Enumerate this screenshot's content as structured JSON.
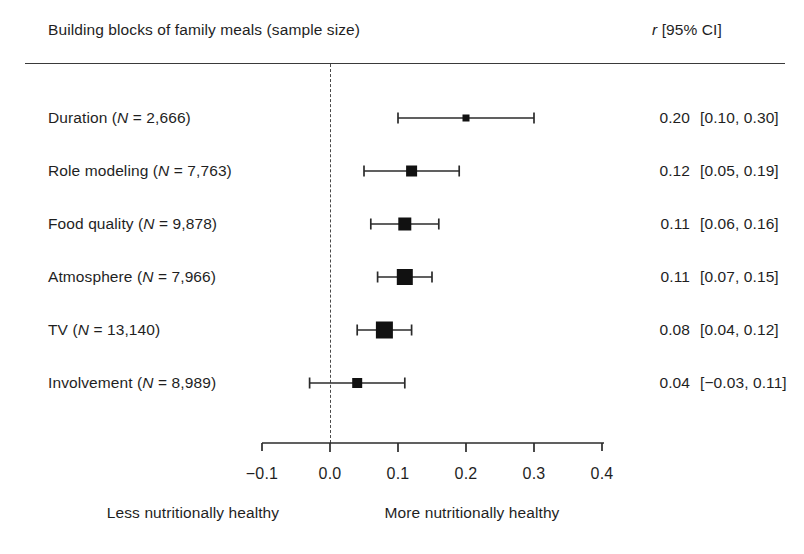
{
  "header": {
    "left_title": "Building blocks of family meals (sample size)",
    "right_title_italic": "r",
    "right_title_rest": " [95% CI]"
  },
  "footer": {
    "left_caption": "Less nutritionally healthy",
    "right_caption": "More nutritionally healthy"
  },
  "axis": {
    "tick_labels": [
      "−0.1",
      "0.0",
      "0.1",
      "0.2",
      "0.3",
      "0.4"
    ],
    "tick_values": [
      -0.1,
      0.0,
      0.1,
      0.2,
      0.3,
      0.4
    ]
  },
  "rows": [
    {
      "name": "Duration",
      "n_label": "2,666",
      "label_prefix": "Duration (",
      "label_italic": "N",
      "label_suffix": " = 2,666)",
      "estimate_label": "0.20",
      "ci_label": "[0.10, 0.30]"
    },
    {
      "name": "Role modeling",
      "n_label": "7,763",
      "label_prefix": "Role modeling (",
      "label_italic": "N",
      "label_suffix": " = 7,763)",
      "estimate_label": "0.12",
      "ci_label": "[0.05, 0.19]"
    },
    {
      "name": "Food quality",
      "n_label": "9,878",
      "label_prefix": "Food quality (",
      "label_italic": "N",
      "label_suffix": " = 9,878)",
      "estimate_label": "0.11",
      "ci_label": "[0.06, 0.16]"
    },
    {
      "name": "Atmosphere",
      "n_label": "7,966",
      "label_prefix": "Atmosphere (",
      "label_italic": "N",
      "label_suffix": " = 7,966)",
      "estimate_label": "0.11",
      "ci_label": "[0.07, 0.15]"
    },
    {
      "name": "TV",
      "n_label": "13,140",
      "label_prefix": "TV (",
      "label_italic": "N",
      "label_suffix": " = 13,140)",
      "estimate_label": "0.08",
      "ci_label": "[0.04, 0.12]"
    },
    {
      "name": "Involvement",
      "n_label": "8,989",
      "label_prefix": "Involvement (",
      "label_italic": "N",
      "label_suffix": " = 8,989)",
      "estimate_label": "0.04",
      "ci_label": "[−0.03, 0.11]"
    }
  ],
  "colors": {
    "marker": "#111111",
    "line": "#2b2b2b",
    "rule": "#3a3a3a",
    "zero_line": "#4a4a4a",
    "text": "#1f1f1f",
    "background": "#ffffff"
  },
  "chart_data": {
    "type": "scatter",
    "subtype": "forest-plot",
    "title": "Building blocks of family meals (sample size)",
    "xlabel": "",
    "ylabel": "",
    "xlim": [
      -0.14,
      0.44
    ],
    "xticks": [
      -0.1,
      0.0,
      0.1,
      0.2,
      0.3,
      0.4
    ],
    "grid": false,
    "legend": "none",
    "reference_line": 0.0,
    "effect_measure": "r",
    "ci_level": "95%",
    "categories": [
      "Duration",
      "Role modeling",
      "Food quality",
      "Atmosphere",
      "TV",
      "Involvement"
    ],
    "sample_sizes": [
      2666,
      7763,
      9878,
      7966,
      13140,
      8989
    ],
    "values": [
      0.2,
      0.12,
      0.11,
      0.11,
      0.08,
      0.04
    ],
    "ci_low": [
      0.1,
      0.05,
      0.06,
      0.07,
      0.04,
      -0.03
    ],
    "ci_high": [
      0.3,
      0.19,
      0.16,
      0.15,
      0.12,
      0.11
    ],
    "marker_sizes_px": [
      7,
      11,
      13,
      16,
      17,
      10
    ],
    "annotations": [
      "Less nutritionally healthy",
      "More nutritionally healthy"
    ]
  },
  "geometry": {
    "x_zero_px": 330,
    "px_per_unit": 680,
    "row_y_px": [
      118,
      171,
      224,
      277,
      330,
      383
    ],
    "axis_y_px": 443,
    "axis_left_px": 262,
    "axis_right_px": 604,
    "tick_label_y_px": 466,
    "footer_y_px": 512,
    "est_right_px": 690,
    "ci_left_px": 700
  }
}
